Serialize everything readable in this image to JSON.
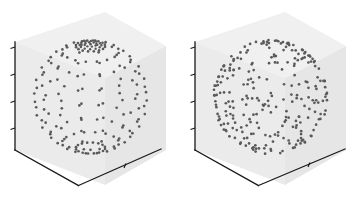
{
  "figure": {
    "title": "",
    "background": "#ffffff",
    "panel_background": "#ebebeb",
    "axis_color": "#1a1a1a",
    "point_color": "#5a5a5a",
    "panel_count": 2
  },
  "panels": [
    {
      "id": "panel-left",
      "name": "structured-lat-long-sphere",
      "label": "",
      "sampling": "latitude-longitude grid",
      "n_latitudes": 13,
      "n_longitudes": 16,
      "point_count": 212,
      "sphere_radius": 1.0,
      "ticks_vertical": 4,
      "ticks_bottom": 1
    },
    {
      "id": "panel-right",
      "name": "uniform-random-sphere",
      "label": "",
      "sampling": "uniform random on sphere",
      "point_count": 260,
      "sphere_radius": 1.0,
      "ticks_vertical": 4,
      "ticks_bottom": 1
    }
  ],
  "chart_data": {
    "type": "scatter",
    "title": "",
    "xlabel": "",
    "ylabel": "",
    "zlabel": "",
    "projection": "3d",
    "grid": false,
    "legend": null,
    "xlim": [
      -1,
      1
    ],
    "ylim": [
      -1,
      1
    ],
    "zlim": [
      -1,
      1
    ],
    "xticklabels": [],
    "yticklabels": [],
    "zticklabels": [],
    "series": [
      {
        "name": "structured-lat-long-sphere",
        "panel": "panel-left",
        "marker": "circle",
        "color": "#5a5a5a",
        "description": "Points placed on a regular latitude-longitude mesh of the unit sphere; meridians converge at the visible north pole and rings of constant latitude are clearly visible.",
        "n_points": 212,
        "lat_count": 13,
        "lon_count": 16,
        "lat_degrees": [
          90,
          75,
          60,
          45,
          30,
          15,
          0,
          -15,
          -30,
          -45,
          -60,
          -75,
          -90
        ],
        "lon_degrees": [
          0,
          22.5,
          45,
          67.5,
          90,
          112.5,
          135,
          157.5,
          180,
          202.5,
          225,
          247.5,
          270,
          292.5,
          315,
          337.5
        ]
      },
      {
        "name": "uniform-random-sphere",
        "panel": "panel-right",
        "marker": "circle",
        "color": "#5a5a5a",
        "description": "Points drawn uniformly at random over the surface of the unit sphere; no ring or meridian structure, denser silhouette near the limb.",
        "n_points": 260
      }
    ]
  }
}
